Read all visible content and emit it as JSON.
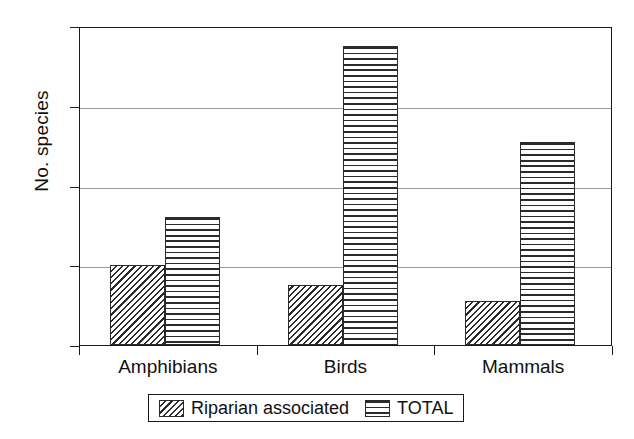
{
  "chart_data": {
    "type": "bar",
    "title": "",
    "xlabel": "",
    "ylabel": "No. species",
    "categories": [
      "Amphibians",
      "Birds",
      "Mammals"
    ],
    "series": [
      {
        "name": "Riparian associated",
        "pattern": "diagonal-hatch",
        "values": [
          10,
          7.5,
          5.5
        ]
      },
      {
        "name": "TOTAL",
        "pattern": "horizontal-lines",
        "values": [
          16,
          37.5,
          25.5
        ]
      }
    ],
    "ylim": [
      0,
      40
    ],
    "yticks": [
      0,
      10,
      20,
      30,
      40
    ],
    "ytick_labels": [
      "0",
      "10",
      "20",
      "30",
      "40"
    ],
    "grid": true,
    "grid_axis": "y",
    "legend_position": "bottom",
    "colors": {
      "axis": "#1a1a1a",
      "grid": "#9a9a9a",
      "bar_outline": "#2a2a2a",
      "hatch": "#2b2b2b",
      "background": "#ffffff"
    }
  }
}
